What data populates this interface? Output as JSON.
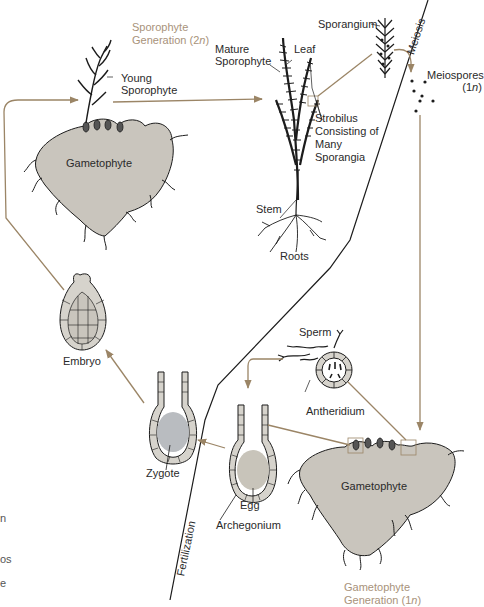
{
  "diagram": {
    "generations": {
      "sporophyte": {
        "line1": "Sporophyte",
        "line2": "Generation (2",
        "ploidy": "n",
        "close": ")"
      },
      "gametophyte": {
        "line1": "Gametophyte",
        "line2": "Generation (1",
        "ploidy": "n",
        "close": ")"
      }
    },
    "transitions": {
      "meiosis": "Meiosis",
      "fertilization": "Fertilization"
    },
    "labels": {
      "young_sporophyte": [
        "Young",
        "Sporophyte"
      ],
      "mature_sporophyte": [
        "Mature",
        "Sporophyte"
      ],
      "leaf": "Leaf",
      "strobilus": [
        "Strobilus",
        "Consisting of",
        "Many",
        "Sporangia"
      ],
      "stem": "Stem",
      "roots": "Roots",
      "sporangium": "Sporangium",
      "meiospores": [
        "Meiospores",
        "(1",
        "n",
        ")"
      ],
      "gametophyte_top": "Gametophyte",
      "gametophyte_bottom": "Gametophyte",
      "embryo": "Embryo",
      "zygote": "Zygote",
      "egg": "Egg",
      "archegonium": "Archegonium",
      "sperm": "Sperm",
      "antheridium": "Antheridium"
    },
    "left_edge_fragments": [
      "n",
      "os",
      "e"
    ],
    "colors": {
      "arrow": "#9b8566",
      "generation_text": "#a8927a",
      "thallus_fill": "#c9c5bd",
      "cell_fill": "#d6d3cc",
      "zygote_fill": "#b9bcc0",
      "egg_fill": "#c8c4ba",
      "ink": "#1c1c1c"
    }
  }
}
